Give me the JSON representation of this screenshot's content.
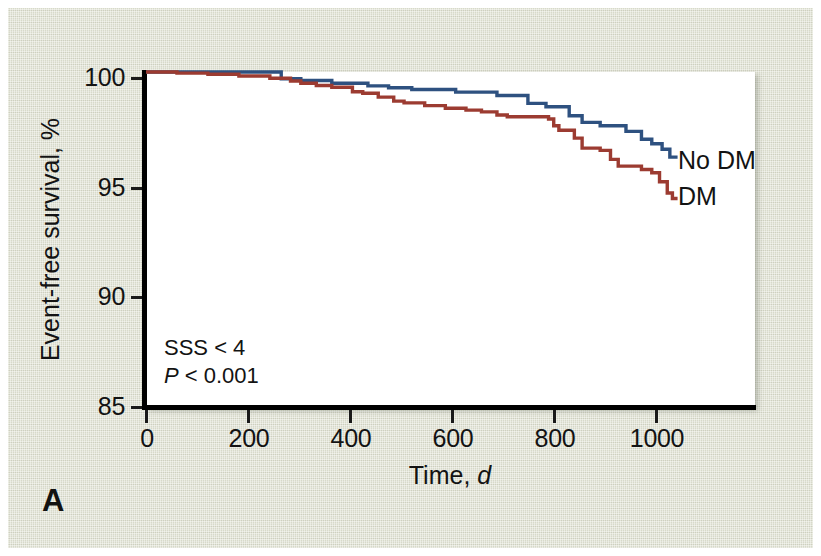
{
  "figure": {
    "panel_letter": "A",
    "background_color": "#dfe1d1",
    "plot_background": "#ffffff"
  },
  "annotations": {
    "sss_line": "SSS < 4",
    "p_italic": "P",
    "p_rest": " < 0.001"
  },
  "series_labels": {
    "no_dm": "No DM",
    "dm": "DM"
  },
  "axes": {
    "y_title": "Event-free survival, %",
    "x_title_main": "Time, ",
    "x_title_italic": "d",
    "y_ticks": [
      "85",
      "90",
      "95",
      "100"
    ],
    "x_ticks": [
      "0",
      "200",
      "400",
      "600",
      "800",
      "1000"
    ]
  },
  "chart_data": {
    "type": "line",
    "title": "",
    "subtitle": "",
    "xlabel": "Time, d",
    "ylabel": "Event-free survival, %",
    "xlim": [
      0,
      1180
    ],
    "ylim": [
      85,
      100
    ],
    "xticks": [
      0,
      200,
      400,
      600,
      800,
      1000
    ],
    "yticks": [
      85,
      90,
      95,
      100
    ],
    "grid": false,
    "legend_position": "right-of-curve-endpoints",
    "step_type": "post",
    "annotations": [
      "SSS < 4",
      "P < 0.001"
    ],
    "panel": "A",
    "series": [
      {
        "name": "No DM",
        "color": "#2e5180",
        "x": [
          0,
          260,
          262,
          290,
          300,
          320,
          355,
          360,
          400,
          430,
          465,
          470,
          510,
          515,
          560,
          600,
          640,
          680,
          700,
          740,
          770,
          775,
          800,
          820,
          830,
          845,
          855,
          880,
          900,
          930,
          960,
          980,
          1000,
          1015,
          1030
        ],
        "y": [
          100.0,
          100.0,
          99.7,
          99.7,
          99.62,
          99.62,
          99.62,
          99.5,
          99.5,
          99.38,
          99.38,
          99.3,
          99.3,
          99.22,
          99.22,
          99.1,
          99.1,
          98.95,
          98.95,
          98.6,
          98.6,
          98.45,
          98.45,
          98.05,
          98.05,
          97.75,
          97.75,
          97.6,
          97.6,
          97.35,
          97.0,
          96.8,
          96.55,
          96.2,
          96.2
        ]
      },
      {
        "name": "DM",
        "color": "#9c3b31",
        "x": [
          0,
          60,
          120,
          180,
          240,
          280,
          300,
          330,
          360,
          400,
          420,
          450,
          480,
          500,
          540,
          580,
          620,
          650,
          680,
          700,
          720,
          740,
          760,
          780,
          790,
          800,
          815,
          830,
          845,
          860,
          880,
          900,
          915,
          930,
          960,
          980,
          995,
          1010,
          1020,
          1030
        ],
        "y": [
          100.0,
          99.95,
          99.9,
          99.82,
          99.72,
          99.6,
          99.5,
          99.4,
          99.32,
          99.12,
          99.05,
          98.88,
          98.7,
          98.62,
          98.5,
          98.38,
          98.3,
          98.22,
          98.08,
          98.0,
          98.0,
          98.0,
          98.0,
          97.9,
          97.6,
          97.4,
          97.4,
          97.05,
          96.6,
          96.6,
          96.5,
          96.1,
          95.8,
          95.8,
          95.65,
          95.5,
          95.1,
          94.6,
          94.35,
          94.35
        ]
      }
    ]
  }
}
